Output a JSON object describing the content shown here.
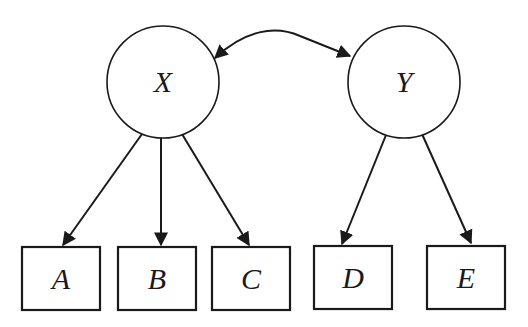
{
  "diagram": {
    "type": "structural-equation-model",
    "latent_nodes": [
      {
        "id": "X",
        "label": "X",
        "cx": 163,
        "cy": 82,
        "r": 56
      },
      {
        "id": "Y",
        "label": "Y",
        "cx": 404,
        "cy": 82,
        "r": 56
      }
    ],
    "observed_nodes": [
      {
        "id": "A",
        "label": "A",
        "x": 22,
        "y": 247,
        "w": 78,
        "h": 63
      },
      {
        "id": "B",
        "label": "B",
        "x": 118,
        "y": 247,
        "w": 78,
        "h": 63
      },
      {
        "id": "C",
        "label": "C",
        "x": 212,
        "y": 247,
        "w": 78,
        "h": 63
      },
      {
        "id": "D",
        "label": "D",
        "x": 314,
        "y": 246,
        "w": 78,
        "h": 63
      },
      {
        "id": "E",
        "label": "E",
        "x": 427,
        "y": 246,
        "w": 78,
        "h": 63
      }
    ],
    "edges": [
      {
        "from": "X",
        "to": "A",
        "type": "directed"
      },
      {
        "from": "X",
        "to": "B",
        "type": "directed"
      },
      {
        "from": "X",
        "to": "C",
        "type": "directed"
      },
      {
        "from": "Y",
        "to": "D",
        "type": "directed"
      },
      {
        "from": "Y",
        "to": "E",
        "type": "directed"
      },
      {
        "from": "X",
        "to": "Y",
        "type": "bidirectional-covariance"
      }
    ],
    "colors": {
      "stroke": "#1a1a1a",
      "background": "#ffffff"
    }
  }
}
